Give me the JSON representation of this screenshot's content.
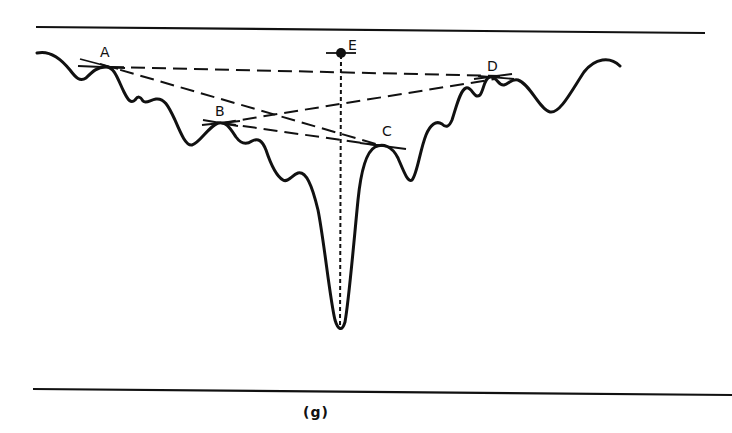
{
  "figure": {
    "caption": "(g)",
    "points": [
      {
        "id": "A",
        "label": "A",
        "x": 107,
        "y": 67,
        "label_x": 100,
        "label_y": 57
      },
      {
        "id": "B",
        "label": "B",
        "x": 222,
        "y": 123,
        "label_x": 215,
        "label_y": 116
      },
      {
        "id": "C",
        "label": "C",
        "x": 383,
        "y": 146,
        "label_x": 382,
        "label_y": 136
      },
      {
        "id": "D",
        "label": "D",
        "x": 490,
        "y": 77,
        "label_x": 487,
        "label_y": 71
      },
      {
        "id": "E",
        "label": "E",
        "x": 341,
        "y": 53,
        "label_x": 348,
        "label_y": 50
      }
    ],
    "connections": [
      [
        "A",
        "D"
      ],
      [
        "A",
        "C"
      ],
      [
        "B",
        "D"
      ],
      [
        "B",
        "C"
      ]
    ],
    "valley_bottom": {
      "x": 340,
      "y": 330
    },
    "colors": {
      "ink": "#111111",
      "background": "#ffffff"
    }
  }
}
